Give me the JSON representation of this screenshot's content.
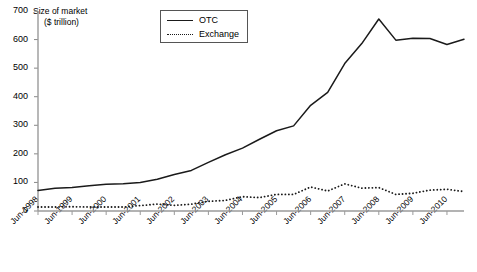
{
  "chart_data": {
    "type": "line",
    "title": "",
    "ylabel_line1": "Size of market",
    "ylabel_line2": "($ trillion)",
    "xlabel": "",
    "ylim": [
      0,
      700
    ],
    "yticks": [
      0,
      100,
      200,
      300,
      400,
      500,
      600,
      700
    ],
    "grid": false,
    "legend_position": "top-center",
    "categories": [
      "Jun-1998",
      "Dec-1998",
      "Jun-1999",
      "Dec-1999",
      "Jun-2000",
      "Dec-2000",
      "Jun-2001",
      "Dec-2001",
      "Jun-2002",
      "Dec-2002",
      "Jun-2003",
      "Dec-2003",
      "Jun-2004",
      "Dec-2004",
      "Jun-2005",
      "Dec-2005",
      "Jun-2006",
      "Dec-2006",
      "Jun-2007",
      "Dec-2007",
      "Jun-2008",
      "Dec-2008",
      "Jun-2009",
      "Dec-2009",
      "Jun-2010",
      "Dec-2010"
    ],
    "xtick_labels": [
      "Jun-1998",
      "Jun-1999",
      "Jun-2000",
      "Jun-2001",
      "Jun-2002",
      "Jun-2003",
      "Jun-2004",
      "Jun-2005",
      "Jun-2006",
      "Jun-2007",
      "Jun-2008",
      "Jun-2009",
      "Jun-2010"
    ],
    "series": [
      {
        "name": "OTC",
        "style": "solid",
        "color": "#1a1a1a",
        "values": [
          72,
          80,
          82,
          88,
          94,
          95,
          100,
          111,
          128,
          142,
          170,
          197,
          220,
          251,
          281,
          298,
          370,
          415,
          516,
          586,
          672,
          598,
          605,
          604,
          583,
          601
        ]
      },
      {
        "name": "Exchange",
        "style": "dotted",
        "color": "#1a1a1a",
        "values": [
          14,
          14,
          15,
          14,
          14,
          14,
          19,
          24,
          20,
          24,
          34,
          37,
          50,
          47,
          58,
          58,
          84,
          70,
          95,
          80,
          82,
          58,
          62,
          73,
          76,
          68
        ]
      }
    ]
  },
  "legend": {
    "items": [
      {
        "label": "OTC",
        "style": "solid"
      },
      {
        "label": "Exchange",
        "style": "dotted"
      }
    ]
  }
}
